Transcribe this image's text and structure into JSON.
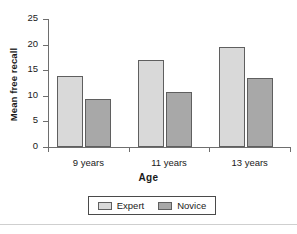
{
  "chart_data": {
    "type": "bar",
    "title": "",
    "xlabel": "Age",
    "ylabel": "Mean free recall",
    "categories": [
      "9 years",
      "11 years",
      "13 years"
    ],
    "series": [
      {
        "name": "Expert",
        "values": [
          13.9,
          17.0,
          19.6
        ],
        "color": "#d9d9d9"
      },
      {
        "name": "Novice",
        "values": [
          9.4,
          10.8,
          13.5
        ],
        "color": "#a8a8a8"
      }
    ],
    "ylim": [
      0,
      25
    ],
    "ytick_labels": [
      "0",
      "5",
      "10",
      "15",
      "20",
      "25"
    ],
    "ytick_values": [
      0,
      5,
      10,
      15,
      20,
      25
    ],
    "grid": false,
    "legend_position": "bottom",
    "legend_entries": [
      "Expert",
      "Novice"
    ]
  },
  "axis": {
    "y_title": "Mean free recall",
    "x_title": "Age"
  }
}
